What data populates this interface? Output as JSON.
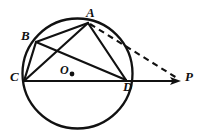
{
  "figure": {
    "kind": "circle-geometry-diagram",
    "width": 204,
    "height": 134,
    "background_color": "#ffffff",
    "stroke_color": "#111111",
    "labels": {
      "A": "A",
      "B": "B",
      "C": "C",
      "D": "D",
      "O": "O",
      "P": "P",
      "center_dot": "●"
    },
    "circle": {
      "center_x": 77.5,
      "center_y": 73.5,
      "radius": 55,
      "stroke_width": 2.2
    },
    "points": {
      "A": {
        "x": 88,
        "y": 22
      },
      "B": {
        "x": 36,
        "y": 42
      },
      "C": {
        "x": 24,
        "y": 81
      },
      "D": {
        "x": 126,
        "y": 80
      },
      "O": {
        "x": 77.5,
        "y": 73.5
      },
      "P": {
        "x": 180,
        "y": 81
      }
    },
    "chords": [
      {
        "name": "chord-AB",
        "from": "A",
        "to": "B",
        "style": "solid"
      },
      {
        "name": "chord-AC",
        "from": "A",
        "to": "C",
        "style": "solid"
      },
      {
        "name": "chord-AD",
        "from": "A",
        "to": "D",
        "style": "solid"
      },
      {
        "name": "chord-BC",
        "from": "B",
        "to": "C",
        "style": "solid"
      },
      {
        "name": "chord-BD",
        "from": "B",
        "to": "D",
        "style": "solid"
      },
      {
        "name": "chord-CD",
        "from": "C",
        "to": "D",
        "style": "solid"
      }
    ],
    "rays": [
      {
        "name": "ray-CP",
        "from": "C",
        "to": "P",
        "style": "solid",
        "arrowhead": true
      },
      {
        "name": "ray-AP",
        "from": "A",
        "to": "P",
        "style": "dashed",
        "arrowhead": false
      }
    ],
    "dash_pattern": "6 4.5"
  }
}
